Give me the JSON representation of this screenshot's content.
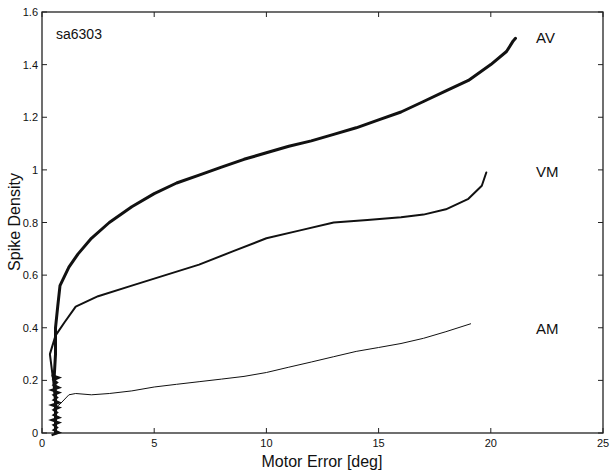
{
  "chart_data": {
    "type": "line",
    "title": "",
    "annotation": "sa6303",
    "xlabel": "Motor Error [deg]",
    "ylabel": "Spike Density",
    "xlim": [
      0,
      25
    ],
    "ylim": [
      0,
      1.6
    ],
    "xticks": [
      0,
      5,
      10,
      15,
      20,
      25
    ],
    "yticks": [
      0,
      0.2,
      0.4,
      0.6,
      0.8,
      1,
      1.2,
      1.4,
      1.6
    ],
    "xtick_labels": [
      "0",
      "5",
      "10",
      "15",
      "20",
      "25"
    ],
    "ytick_labels": [
      "0",
      "0.2",
      "0.4",
      "0.6",
      "0.8",
      "1",
      "1.2",
      "1.4",
      "1.6"
    ],
    "grid": false,
    "legend": "inline labels at right",
    "series": [
      {
        "name": "AV",
        "line_width": 3,
        "x": [
          0.6,
          0.6,
          0.6,
          0.55,
          0.6,
          0.6,
          0.7,
          0.8,
          1.2,
          1.6,
          2.2,
          3.0,
          4.0,
          5.0,
          6.0,
          7.0,
          8.0,
          9.0,
          10.0,
          11.0,
          12.0,
          13.0,
          14.0,
          15.0,
          16.0,
          17.0,
          18.0,
          19.0,
          20.0,
          20.7,
          21.0,
          21.1
        ],
        "y": [
          0.0,
          0.08,
          0.15,
          0.22,
          0.3,
          0.4,
          0.48,
          0.56,
          0.63,
          0.68,
          0.74,
          0.8,
          0.86,
          0.91,
          0.95,
          0.98,
          1.01,
          1.04,
          1.065,
          1.09,
          1.11,
          1.135,
          1.16,
          1.19,
          1.22,
          1.26,
          1.3,
          1.34,
          1.4,
          1.45,
          1.49,
          1.5
        ]
      },
      {
        "name": "VM",
        "line_width": 2,
        "x": [
          0.6,
          0.6,
          0.5,
          0.35,
          0.6,
          1.0,
          1.5,
          2.5,
          4.0,
          5.5,
          7.0,
          8.5,
          10.0,
          11.5,
          13.0,
          14.5,
          16.0,
          17.0,
          18.0,
          19.0,
          19.6,
          19.8
        ],
        "y": [
          0.0,
          0.1,
          0.2,
          0.3,
          0.37,
          0.42,
          0.48,
          0.52,
          0.56,
          0.6,
          0.64,
          0.69,
          0.74,
          0.77,
          0.8,
          0.81,
          0.82,
          0.83,
          0.85,
          0.89,
          0.94,
          0.99
        ]
      },
      {
        "name": "AM",
        "line_width": 1,
        "x": [
          0.5,
          0.8,
          1.2,
          1.5,
          2.2,
          3.0,
          4.0,
          5.0,
          6.0,
          7.0,
          8.0,
          9.0,
          10.0,
          11.0,
          12.0,
          13.0,
          14.0,
          15.0,
          16.0,
          17.0,
          18.0,
          19.1
        ],
        "y": [
          0.09,
          0.11,
          0.145,
          0.15,
          0.145,
          0.15,
          0.16,
          0.175,
          0.185,
          0.195,
          0.205,
          0.215,
          0.23,
          0.25,
          0.27,
          0.29,
          0.31,
          0.325,
          0.34,
          0.36,
          0.385,
          0.415
        ]
      }
    ]
  },
  "labels": {
    "annotation": "sa6303",
    "xlabel": "Motor Error [deg]",
    "ylabel": "Spike Density",
    "series": [
      "AV",
      "VM",
      "AM"
    ]
  }
}
